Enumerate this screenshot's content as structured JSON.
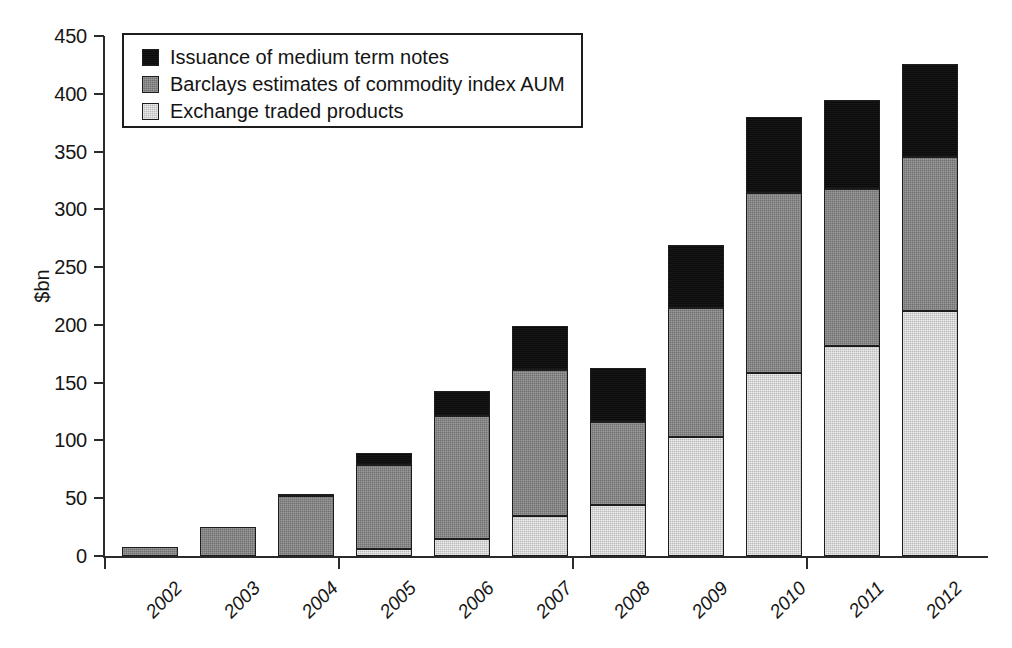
{
  "chart_data": {
    "type": "bar",
    "subtype": "stacked-vertical",
    "title": "",
    "xlabel": "",
    "ylabel": "$bn",
    "ylim": [
      0,
      450
    ],
    "yticks": [
      0,
      50,
      100,
      150,
      200,
      250,
      300,
      350,
      400,
      450
    ],
    "ytick_labels": [
      "0",
      "50",
      "100",
      "150",
      "200",
      "250",
      "300",
      "350",
      "400",
      "450"
    ],
    "grid": false,
    "legend_position": "top-left-inside",
    "categories": [
      "2002",
      "2003",
      "2004",
      "2005",
      "2006",
      "2007",
      "2008",
      "2009",
      "2010",
      "2011",
      "2012"
    ],
    "series": [
      {
        "name": "Exchange traded products",
        "color": "#cfcfcf",
        "values": [
          0,
          0,
          0,
          6,
          15,
          35,
          44,
          103,
          158,
          182,
          212
        ]
      },
      {
        "name": "Barclays estimates of commodity index AUM",
        "color": "#838383",
        "values": [
          8,
          25,
          52,
          73,
          106,
          126,
          72,
          112,
          156,
          136,
          133
        ]
      },
      {
        "name": "Issuance of medium term notes",
        "color": "#0b0b0b",
        "values": [
          0,
          0,
          2,
          10,
          22,
          38,
          47,
          54,
          66,
          77,
          81
        ]
      }
    ],
    "totals": [
      8,
      25,
      54,
      89,
      143,
      199,
      163,
      269,
      380,
      395,
      426
    ],
    "stack_order_bottom_to_top": [
      "Exchange traded products",
      "Barclays estimates of commodity index AUM",
      "Issuance of medium term notes"
    ]
  },
  "legend": {
    "items": [
      {
        "label": "Issuance of medium term notes",
        "swatch": "black-swatch-icon"
      },
      {
        "label": "Barclays estimates of commodity index AUM",
        "swatch": "mid-gray-swatch-icon"
      },
      {
        "label": "Exchange traded products",
        "swatch": "light-gray-swatch-icon"
      }
    ]
  },
  "axis": {
    "y_title": "$bn"
  }
}
